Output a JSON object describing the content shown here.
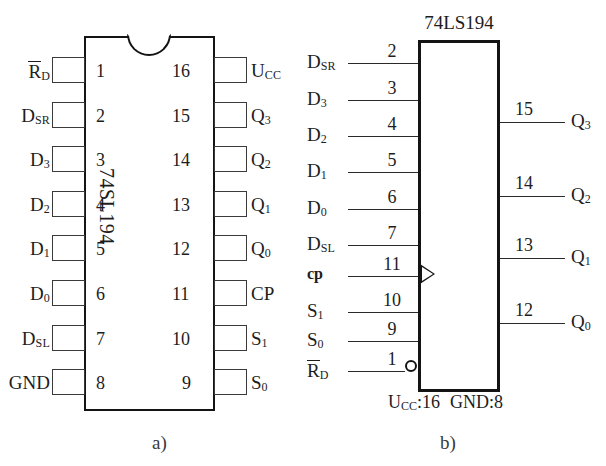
{
  "figure": {
    "background": "#ffffff",
    "ink": "#1d1d1d",
    "captions": {
      "left": "a)",
      "right": "b)"
    }
  },
  "dip_package": {
    "chip_title": "74SL194",
    "notch_icon": "package-notch-icon",
    "left_pins": [
      {
        "number": "1",
        "label": "R",
        "sub": "D",
        "overline": true
      },
      {
        "number": "2",
        "label": "D",
        "sub": "SR",
        "overline": false
      },
      {
        "number": "3",
        "label": "D",
        "sub": "3",
        "overline": false
      },
      {
        "number": "4",
        "label": "D",
        "sub": "2",
        "overline": false
      },
      {
        "number": "5",
        "label": "D",
        "sub": "1",
        "overline": false
      },
      {
        "number": "6",
        "label": "D",
        "sub": "0",
        "overline": false
      },
      {
        "number": "7",
        "label": "D",
        "sub": "SL",
        "overline": false
      },
      {
        "number": "8",
        "label": "GND",
        "sub": "",
        "overline": false
      }
    ],
    "right_pins": [
      {
        "number": "16",
        "label": "U",
        "sub": "CC",
        "overline": false
      },
      {
        "number": "15",
        "label": "Q",
        "sub": "3",
        "overline": false
      },
      {
        "number": "14",
        "label": "Q",
        "sub": "2",
        "overline": false
      },
      {
        "number": "13",
        "label": "Q",
        "sub": "1",
        "overline": false
      },
      {
        "number": "12",
        "label": "Q",
        "sub": "0",
        "overline": false
      },
      {
        "number": "11",
        "label": "CP",
        "sub": "",
        "overline": false
      },
      {
        "number": "10",
        "label": "S",
        "sub": "1",
        "overline": false
      },
      {
        "number": "9",
        "label": "S",
        "sub": "0",
        "overline": false
      }
    ]
  },
  "logic_block": {
    "chip_title": "74LS194",
    "supply_note": "Uₑₑ:16  GND:8",
    "supply_note_parts": {
      "vcc_label": "U",
      "vcc_sub": "CC",
      "vcc_value": ":16",
      "gnd": "GND:8"
    },
    "clock_icon": "clock-edge-triangle-icon",
    "invert_icon": "inversion-bubble-icon",
    "inputs": [
      {
        "number": "2",
        "label": "D",
        "sub": "SR",
        "overline": false,
        "bold": false
      },
      {
        "number": "3",
        "label": "D",
        "sub": "3",
        "overline": false,
        "bold": false
      },
      {
        "number": "4",
        "label": "D",
        "sub": "2",
        "overline": false,
        "bold": false
      },
      {
        "number": "5",
        "label": "D",
        "sub": "1",
        "overline": false,
        "bold": false
      },
      {
        "number": "6",
        "label": "D",
        "sub": "0",
        "overline": false,
        "bold": false
      },
      {
        "number": "7",
        "label": "D",
        "sub": "SL",
        "overline": false,
        "bold": false
      },
      {
        "number": "11",
        "label": "cp",
        "sub": "",
        "overline": false,
        "bold": true
      },
      {
        "number": "10",
        "label": "S",
        "sub": "1",
        "overline": false,
        "bold": false
      },
      {
        "number": "9",
        "label": "S",
        "sub": "0",
        "overline": false,
        "bold": false
      },
      {
        "number": "1",
        "label": "R",
        "sub": "D",
        "overline": true,
        "bold": false
      }
    ],
    "outputs": [
      {
        "number": "15",
        "label": "Q",
        "sub": "3"
      },
      {
        "number": "14",
        "label": "Q",
        "sub": "2"
      },
      {
        "number": "13",
        "label": "Q",
        "sub": "1"
      },
      {
        "number": "12",
        "label": "Q",
        "sub": "0"
      }
    ]
  }
}
